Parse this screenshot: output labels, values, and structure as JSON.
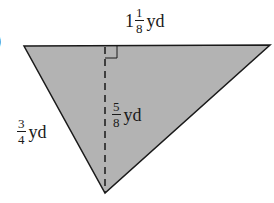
{
  "figure": {
    "part_marker": ")",
    "shape": "triangle",
    "fill_color": "#b3b3b3",
    "stroke_color": "#1a1a1a",
    "vertices": [
      [
        24,
        46
      ],
      [
        270,
        45
      ],
      [
        105,
        193
      ]
    ],
    "height_line": {
      "x": 105,
      "y1": 46,
      "y2": 193,
      "style": "dashed"
    },
    "right_angle_marker": {
      "x": 105,
      "y": 46,
      "size": 12
    }
  },
  "labels": {
    "top": {
      "whole": "1",
      "num": "1",
      "den": "8",
      "unit": "yd"
    },
    "height": {
      "num": "5",
      "den": "8",
      "unit": "yd"
    },
    "left": {
      "num": "3",
      "den": "4",
      "unit": "yd"
    }
  }
}
